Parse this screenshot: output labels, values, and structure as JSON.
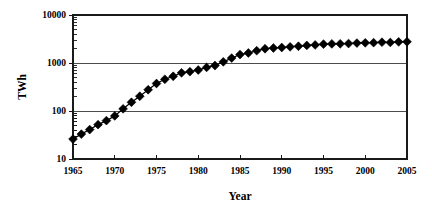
{
  "chart_data": {
    "type": "line",
    "title": "",
    "xlabel": "Year",
    "ylabel": "TWh",
    "xlim": [
      1965,
      2005
    ],
    "ylim": [
      10,
      10000
    ],
    "yscale": "log",
    "xscale": "linear",
    "grid": "horizontal-major-only",
    "legend": "none",
    "marker": "filled-diamond",
    "x_ticks": [
      1965,
      1970,
      1975,
      1980,
      1985,
      1990,
      1995,
      2000,
      2005
    ],
    "x_tick_labels": [
      "1965",
      "1970",
      "1975",
      "1980",
      "1985",
      "1990",
      "1995",
      "2000",
      "2005"
    ],
    "y_ticks": [
      10,
      100,
      1000,
      10000
    ],
    "y_tick_labels": [
      "10",
      "100",
      "1000",
      "10000"
    ],
    "x": [
      1965,
      1966,
      1967,
      1968,
      1969,
      1970,
      1971,
      1972,
      1973,
      1974,
      1975,
      1976,
      1977,
      1978,
      1979,
      1980,
      1981,
      1982,
      1983,
      1984,
      1985,
      1986,
      1987,
      1988,
      1989,
      1990,
      1991,
      1992,
      1993,
      1994,
      1995,
      1996,
      1997,
      1998,
      1999,
      2000,
      2001,
      2002,
      2003,
      2004,
      2005
    ],
    "values": [
      26,
      33,
      41,
      52,
      63,
      79,
      111,
      152,
      203,
      277,
      374,
      458,
      529,
      625,
      660,
      714,
      809,
      886,
      1056,
      1266,
      1499,
      1615,
      1805,
      1980,
      2052,
      2103,
      2170,
      2235,
      2325,
      2380,
      2470,
      2500,
      2510,
      2545,
      2600,
      2635,
      2650,
      2710,
      2680,
      2755,
      2770
    ],
    "series": [
      {
        "name": "TWh",
        "values": [
          26,
          33,
          41,
          52,
          63,
          79,
          111,
          152,
          203,
          277,
          374,
          458,
          529,
          625,
          660,
          714,
          809,
          886,
          1056,
          1266,
          1499,
          1615,
          1805,
          1980,
          2052,
          2103,
          2170,
          2235,
          2325,
          2380,
          2470,
          2500,
          2510,
          2545,
          2600,
          2635,
          2650,
          2710,
          2680,
          2755,
          2770
        ]
      }
    ]
  },
  "layout": {
    "plot_left": 73,
    "plot_right": 407,
    "plot_top": 15,
    "plot_bottom": 159,
    "marker_size": 4.4
  }
}
